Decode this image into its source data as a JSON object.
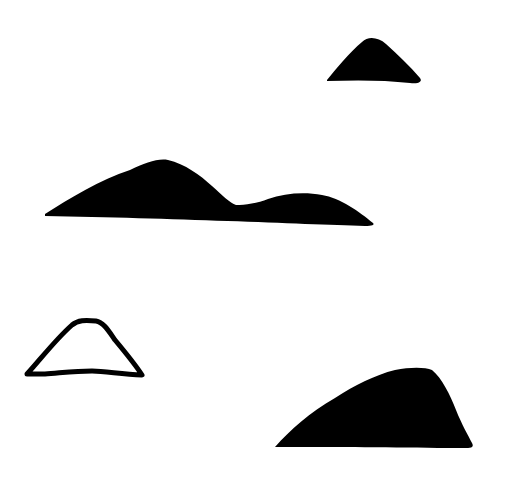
{
  "canvas": {
    "width": 507,
    "height": 490,
    "background": "#ffffff"
  },
  "colors": {
    "fill": "#000000",
    "stroke": "#000000"
  },
  "shapes": [
    {
      "name": "small-filled-triangle",
      "style": "filled"
    },
    {
      "name": "double-hill",
      "style": "filled"
    },
    {
      "name": "outlined-trapezoid-hill",
      "style": "outline"
    },
    {
      "name": "large-filled-hill",
      "style": "filled"
    }
  ]
}
